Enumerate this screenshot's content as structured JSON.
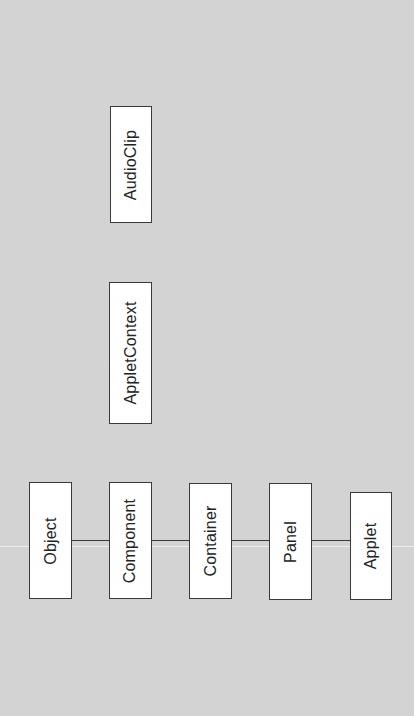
{
  "diagram": {
    "type": "class-hierarchy",
    "orientation": "rotated-90-ccw",
    "background_color": "#d3d3d3",
    "box_fill": "#ffffff",
    "line_color": "#3a3a3a",
    "chain": [
      {
        "id": "object",
        "label": "Object"
      },
      {
        "id": "component",
        "label": "Component"
      },
      {
        "id": "container",
        "label": "Container"
      },
      {
        "id": "panel",
        "label": "Panel"
      },
      {
        "id": "applet",
        "label": "Applet"
      }
    ],
    "edges": [
      {
        "from": "Object",
        "to": "Component"
      },
      {
        "from": "Component",
        "to": "Container"
      },
      {
        "from": "Container",
        "to": "Panel"
      },
      {
        "from": "Panel",
        "to": "Applet"
      }
    ],
    "standalone": [
      {
        "id": "audioclip",
        "label": "AudioClip"
      },
      {
        "id": "appletcontext",
        "label": "AppletContext"
      }
    ]
  }
}
